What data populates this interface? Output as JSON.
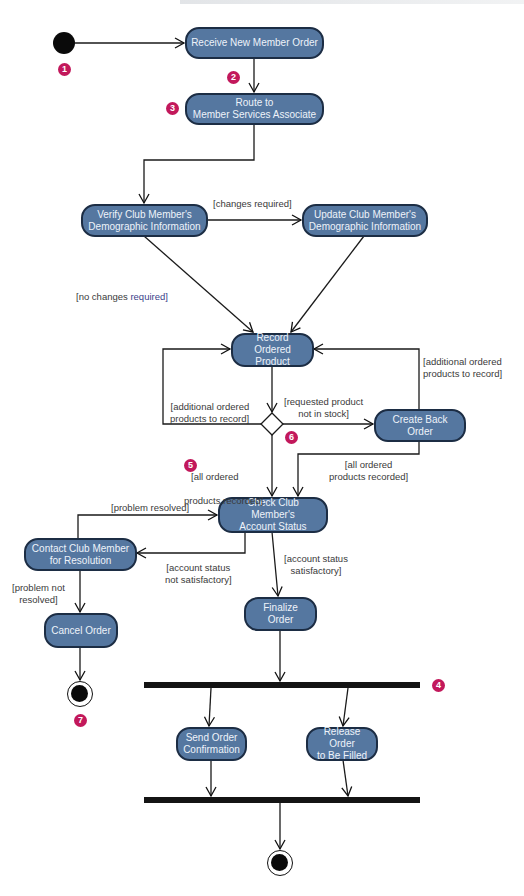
{
  "diagram": {
    "type": "UML activity diagram",
    "colors": {
      "action_fill": "#5577a0",
      "action_border": "#1c2d44",
      "action_text": "#eef3fa",
      "badge": "#c2185b",
      "guard_text": "#3a3a3a",
      "guard_text_blue": "#3b3f8a",
      "bar": "#141414"
    },
    "actions": {
      "receive": "Receive New Member Order",
      "route": "Route to\nMember Services Associate",
      "verify": "Verify Club Member's\nDemographic Information",
      "update": "Update Club Member's\nDemographic Information",
      "record": "Record Ordered\nProduct",
      "back_order": "Create Back Order",
      "check": "Check Club Member's\nAccount Status",
      "contact": "Contact Club Member\nfor Resolution",
      "cancel": "Cancel Order",
      "finalize": "Finalize Order",
      "send": "Send Order\nConfirmation",
      "release": "Release Order\nto Be Filled"
    },
    "guards": {
      "changes_required": "[changes required]",
      "no_changes_required_a": "[no changes ",
      "no_changes_required_b": "required]",
      "additional_right": "[additional ordered\nproducts to record]",
      "additional_left": "[additional ordered\nproducts to record]",
      "not_in_stock": "[requested product\nnot in stock]",
      "all_recorded_left_a": "[all ordered",
      "all_recorded_left_b": "products recorded]",
      "all_recorded_right": "[all ordered\nproducts recorded]",
      "problem_resolved": "[problem resolved]",
      "status_not_ok": "[account status\nnot satisfactory]",
      "status_ok": "[account status\nsatisfactory]",
      "problem_not_resolved": "[problem not\nresolved]"
    },
    "badges": [
      "1",
      "2",
      "3",
      "4",
      "5",
      "6",
      "7"
    ]
  }
}
